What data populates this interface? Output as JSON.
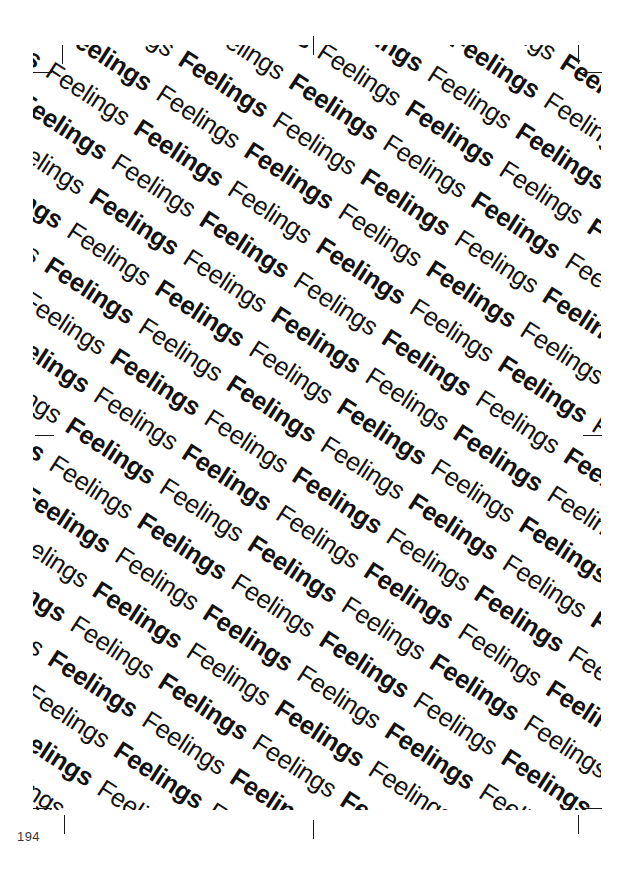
{
  "page": {
    "width": 635,
    "height": 882,
    "background_color": "#ffffff",
    "folio": "194",
    "folio_color": "#3a3a3a"
  },
  "pattern": {
    "word": "Feelings",
    "repeat_count_per_row": 26,
    "row_count": 37,
    "rotation_degrees": 33,
    "weights": [
      "bold",
      "normal"
    ],
    "text_color": "#111111",
    "font_size_px": 25.5,
    "line_height_px": 41,
    "description": "The word Feelings repeated in alternating bold and regular weight, set on diagonal baselines descending left to right"
  },
  "marks": {
    "label": "crop-and-registration-marks",
    "color": "#1a1a1a",
    "items": [
      {
        "name": "crop-mark-top-left-vertical",
        "type": "v",
        "x": 62,
        "y": 45
      },
      {
        "name": "crop-mark-top-left-horizontal",
        "type": "h",
        "x": 33,
        "y": 72
      },
      {
        "name": "crop-mark-top-center",
        "type": "v",
        "x": 313,
        "y": 36
      },
      {
        "name": "crop-mark-top-right-vertical",
        "type": "v",
        "x": 578,
        "y": 45
      },
      {
        "name": "crop-mark-top-right-horizontal",
        "type": "h",
        "x": 583,
        "y": 72
      },
      {
        "name": "crop-mark-left-middle",
        "type": "h",
        "x": 35,
        "y": 435
      },
      {
        "name": "crop-mark-right-middle",
        "type": "h",
        "x": 583,
        "y": 435
      },
      {
        "name": "crop-mark-bottom-left-horizontal",
        "type": "h",
        "x": 33,
        "y": 808
      },
      {
        "name": "crop-mark-bottom-left-vertical",
        "type": "v",
        "x": 64,
        "y": 815
      },
      {
        "name": "crop-mark-bottom-center",
        "type": "v",
        "x": 313,
        "y": 820
      },
      {
        "name": "crop-mark-bottom-right-horizontal",
        "type": "h",
        "x": 583,
        "y": 808
      },
      {
        "name": "crop-mark-bottom-right-vertical",
        "type": "v",
        "x": 578,
        "y": 815
      }
    ]
  }
}
